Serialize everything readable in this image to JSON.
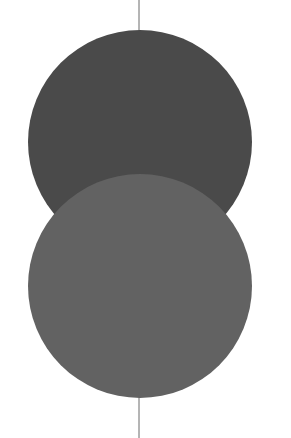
{
  "canvas": {
    "width": 291,
    "height": 438,
    "background": "#ffffff"
  },
  "axis_line": {
    "x": 139,
    "color": "#6a6a6a",
    "width": 1
  },
  "circles": [
    {
      "name": "upper-circle",
      "cx": 140,
      "cy": 142,
      "r": 112,
      "fill": "#4a4a4a"
    },
    {
      "name": "lower-circle",
      "cx": 140,
      "cy": 286,
      "r": 112,
      "fill": "#626262"
    }
  ]
}
